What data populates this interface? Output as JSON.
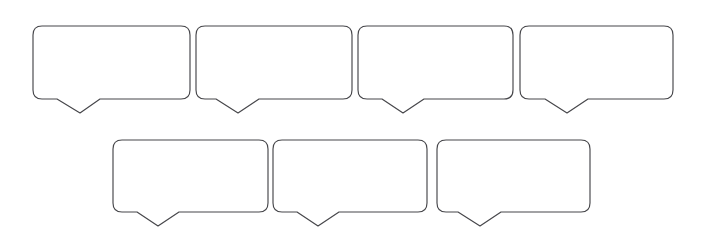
{
  "canvas": {
    "width": 703,
    "height": 244,
    "background_color": "#ffffff",
    "stroke_color": "#46464a",
    "stroke_width": 1.15,
    "fill_color": "#ffffff",
    "corner_radius": 9
  },
  "diagram": {
    "type": "speech-bubble-template",
    "title": "",
    "total_bubbles": 7,
    "row_count": 2
  },
  "rows": [
    {
      "name": "row-1",
      "bubble_count": 4,
      "top": 26,
      "bottom": 99,
      "tail_tip_y": 113
    },
    {
      "name": "row-2",
      "bubble_count": 3,
      "top": 140,
      "bottom": 212,
      "tail_tip_y": 226
    }
  ],
  "bubbles": [
    {
      "id": "bubble-1",
      "row": 1,
      "index": 1,
      "x": 33,
      "y": 26,
      "width": 157,
      "height": 73,
      "radius": 9,
      "tail_left": 57,
      "tail_tip_x": 80,
      "tail_right": 100,
      "tail_depth": 14,
      "text": ""
    },
    {
      "id": "bubble-2",
      "row": 1,
      "index": 2,
      "x": 196,
      "y": 26,
      "width": 156,
      "height": 73,
      "radius": 9,
      "tail_left": 216,
      "tail_tip_x": 238,
      "tail_right": 259,
      "tail_depth": 14,
      "text": ""
    },
    {
      "id": "bubble-3",
      "row": 1,
      "index": 3,
      "x": 358,
      "y": 26,
      "width": 155,
      "height": 73,
      "radius": 9,
      "tail_left": 382,
      "tail_tip_x": 403,
      "tail_right": 424,
      "tail_depth": 14,
      "text": ""
    },
    {
      "id": "bubble-4",
      "row": 1,
      "index": 4,
      "x": 520,
      "y": 26,
      "width": 153,
      "height": 73,
      "radius": 9,
      "tail_left": 545,
      "tail_tip_x": 567,
      "tail_right": 588,
      "tail_depth": 14,
      "text": ""
    },
    {
      "id": "bubble-5",
      "row": 2,
      "index": 1,
      "x": 113,
      "y": 140,
      "width": 155,
      "height": 72,
      "radius": 9,
      "tail_left": 137,
      "tail_tip_x": 158,
      "tail_right": 179,
      "tail_depth": 14,
      "text": ""
    },
    {
      "id": "bubble-6",
      "row": 2,
      "index": 2,
      "x": 273,
      "y": 140,
      "width": 154,
      "height": 72,
      "radius": 9,
      "tail_left": 297,
      "tail_tip_x": 318,
      "tail_right": 339,
      "tail_depth": 14,
      "text": ""
    },
    {
      "id": "bubble-7",
      "row": 2,
      "index": 3,
      "x": 437,
      "y": 140,
      "width": 153,
      "height": 72,
      "radius": 9,
      "tail_left": 458,
      "tail_tip_x": 480,
      "tail_right": 501,
      "tail_depth": 14,
      "text": ""
    }
  ]
}
